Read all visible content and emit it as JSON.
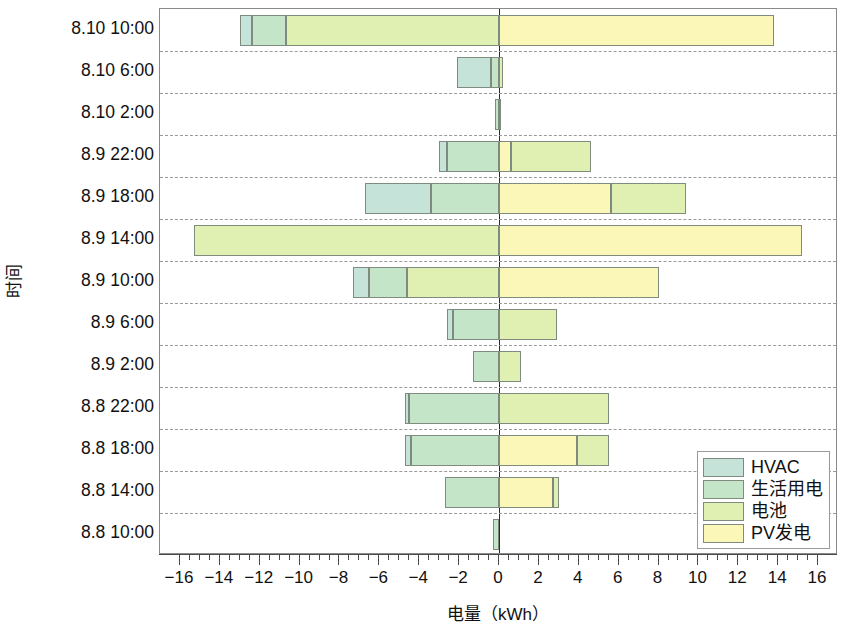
{
  "chart_data": {
    "type": "bar",
    "orientation": "horizontal",
    "stacked": true,
    "title": "",
    "xlabel": "电量（kWh）",
    "ylabel": "时间",
    "xlim": [
      -17,
      17
    ],
    "xticks": [
      -16,
      -14,
      -12,
      -10,
      -8,
      -6,
      -4,
      -2,
      0,
      2,
      4,
      6,
      8,
      10,
      12,
      14,
      16
    ],
    "xtick_labels": [
      "−16",
      "−14",
      "−12",
      "−10",
      "−8",
      "−6",
      "−4",
      "−2",
      "0",
      "2",
      "4",
      "6",
      "8",
      "10",
      "12",
      "14",
      "16"
    ],
    "minor_tick_step": 0.5,
    "grid": "horizontal-dashed",
    "legend_position": "lower-right",
    "categories": [
      "8.10 10:00",
      "8.10 6:00",
      "8.10 2:00",
      "8.9 22:00",
      "8.9 18:00",
      "8.9 14:00",
      "8.9 10:00",
      "8.9 6:00",
      "8.9 2:00",
      "8.8 22:00",
      "8.8 18:00",
      "8.8 14:00",
      "8.8 10:00"
    ],
    "series": [
      {
        "name": "HVAC",
        "color": "#c5e3d8",
        "values": [
          -0.6,
          -1.7,
          0.0,
          -0.4,
          -3.3,
          0.0,
          -0.8,
          -0.3,
          0.0,
          -0.2,
          -0.3,
          0.0,
          0.0
        ]
      },
      {
        "name": "生活用电",
        "color": "#c5e5c8",
        "values": [
          -1.7,
          -0.4,
          -0.2,
          -2.6,
          -3.4,
          0.0,
          -1.8,
          -2.3,
          -1.3,
          -4.5,
          -4.4,
          -2.7,
          -0.3
        ]
      },
      {
        "name": "电池",
        "color": "#e0f0b2",
        "values": [
          -10.7,
          0.2,
          0.1,
          4.0,
          3.8,
          -15.3,
          4.6,
          2.9,
          1.1,
          5.5,
          1.6,
          0.3,
          0.0
        ]
      },
      {
        "name": "PV发电",
        "color": "#fbf7b8",
        "values": [
          13.8,
          0.0,
          0.0,
          0.6,
          5.6,
          15.2,
          3.2,
          0.0,
          0.0,
          0.0,
          3.9,
          2.7,
          0.0
        ]
      }
    ],
    "stack_order_negative": [
      "HVAC",
      "生活用电",
      "电池"
    ],
    "stack_order_positive": [
      "PV发电",
      "电池"
    ]
  },
  "legend": {
    "items": [
      {
        "label": "HVAC",
        "color": "#c5e3d8"
      },
      {
        "label": "生活用电",
        "color": "#c5e5c8"
      },
      {
        "label": "电池",
        "color": "#e0f0b2"
      },
      {
        "label": "PV发电",
        "color": "#fbf7b8"
      }
    ]
  },
  "bars": [
    {
      "category": "8.10 10:00",
      "neg_segments": [
        {
          "series": "HVAC",
          "from": -13.0,
          "to": -12.4
        },
        {
          "series": "生活用电",
          "from": -12.4,
          "to": -10.7
        },
        {
          "series": "电池",
          "from": -10.7,
          "to": 0
        }
      ],
      "pos_segments": [
        {
          "series": "PV发电",
          "from": 0,
          "to": 13.8
        }
      ]
    },
    {
      "category": "8.10 6:00",
      "neg_segments": [
        {
          "series": "HVAC",
          "from": -2.1,
          "to": -0.4
        },
        {
          "series": "生活用电",
          "from": -0.4,
          "to": 0
        }
      ],
      "pos_segments": [
        {
          "series": "电池",
          "from": 0,
          "to": 0.2
        }
      ]
    },
    {
      "category": "8.10 2:00",
      "neg_segments": [
        {
          "series": "生活用电",
          "from": -0.2,
          "to": 0
        }
      ],
      "pos_segments": [
        {
          "series": "电池",
          "from": 0,
          "to": 0.1
        }
      ]
    },
    {
      "category": "8.9 22:00",
      "neg_segments": [
        {
          "series": "HVAC",
          "from": -3.0,
          "to": -2.6
        },
        {
          "series": "生活用电",
          "from": -2.6,
          "to": 0
        }
      ],
      "pos_segments": [
        {
          "series": "PV发电",
          "from": 0,
          "to": 0.6
        },
        {
          "series": "电池",
          "from": 0.6,
          "to": 4.6
        }
      ]
    },
    {
      "category": "8.9 18:00",
      "neg_segments": [
        {
          "series": "HVAC",
          "from": -6.7,
          "to": -3.4
        },
        {
          "series": "生活用电",
          "from": -3.4,
          "to": 0
        }
      ],
      "pos_segments": [
        {
          "series": "PV发电",
          "from": 0,
          "to": 5.6
        },
        {
          "series": "电池",
          "from": 5.6,
          "to": 9.4
        }
      ]
    },
    {
      "category": "8.9 14:00",
      "neg_segments": [
        {
          "series": "电池",
          "from": -15.3,
          "to": 0
        }
      ],
      "pos_segments": [
        {
          "series": "PV发电",
          "from": 0,
          "to": 15.2
        }
      ]
    },
    {
      "category": "8.9 10:00",
      "neg_segments": [
        {
          "series": "HVAC",
          "from": -7.3,
          "to": -6.5
        },
        {
          "series": "生活用电",
          "from": -6.5,
          "to": -4.6
        },
        {
          "series": "电池",
          "from": -4.6,
          "to": 0
        }
      ],
      "pos_segments": [
        {
          "series": "PV发电",
          "from": 0,
          "to": 8.0
        }
      ]
    },
    {
      "category": "8.9 6:00",
      "neg_segments": [
        {
          "series": "HVAC",
          "from": -2.6,
          "to": -2.3
        },
        {
          "series": "生活用电",
          "from": -2.3,
          "to": 0
        }
      ],
      "pos_segments": [
        {
          "series": "电池",
          "from": 0,
          "to": 2.9
        }
      ]
    },
    {
      "category": "8.9 2:00",
      "neg_segments": [
        {
          "series": "生活用电",
          "from": -1.3,
          "to": 0
        }
      ],
      "pos_segments": [
        {
          "series": "电池",
          "from": 0,
          "to": 1.1
        }
      ]
    },
    {
      "category": "8.8 22:00",
      "neg_segments": [
        {
          "series": "HVAC",
          "from": -4.7,
          "to": -4.5
        },
        {
          "series": "生活用电",
          "from": -4.5,
          "to": 0
        }
      ],
      "pos_segments": [
        {
          "series": "电池",
          "from": 0,
          "to": 5.5
        }
      ]
    },
    {
      "category": "8.8 18:00",
      "neg_segments": [
        {
          "series": "HVAC",
          "from": -4.7,
          "to": -4.4
        },
        {
          "series": "生活用电",
          "from": -4.4,
          "to": 0
        }
      ],
      "pos_segments": [
        {
          "series": "PV发电",
          "from": 0,
          "to": 3.9
        },
        {
          "series": "电池",
          "from": 3.9,
          "to": 5.5
        }
      ]
    },
    {
      "category": "8.8 14:00",
      "neg_segments": [
        {
          "series": "生活用电",
          "from": -2.7,
          "to": 0
        }
      ],
      "pos_segments": [
        {
          "series": "PV发电",
          "from": 0,
          "to": 2.7
        },
        {
          "series": "电池",
          "from": 2.7,
          "to": 3.0
        }
      ]
    },
    {
      "category": "8.8 10:00",
      "neg_segments": [
        {
          "series": "生活用电",
          "from": -0.3,
          "to": 0
        }
      ],
      "pos_segments": []
    }
  ]
}
